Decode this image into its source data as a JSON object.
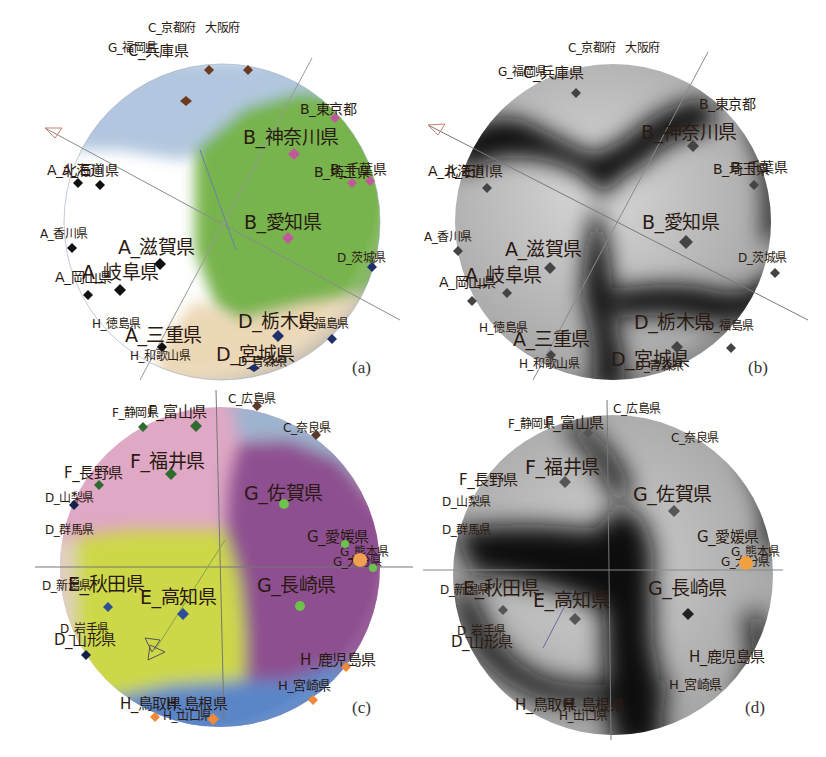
{
  "figure": {
    "panels": [
      {
        "id": "a",
        "tag": "(a)",
        "style": "colored regions",
        "region_colors": {
          "A": "#ffffff",
          "B": "#78b44e",
          "C": "#a9bfd8",
          "D": "#e9d6b4"
        },
        "labels": [
          {
            "text": "C_京都府",
            "size": "s",
            "x": 148,
            "y": 22
          },
          {
            "text": "大阪府",
            "size": "s",
            "x": 205,
            "y": 22
          },
          {
            "text": "G_福岡県",
            "size": "s",
            "x": 108,
            "y": 42
          },
          {
            "text": "C_兵庫県",
            "size": "m",
            "x": 128,
            "y": 44
          },
          {
            "text": "B_東京都",
            "size": "m",
            "x": 300,
            "y": 102
          },
          {
            "text": "B_神奈川県",
            "size": "l",
            "x": 243,
            "y": 128
          },
          {
            "text": "A_北海道",
            "size": "m",
            "x": 47,
            "y": 163
          },
          {
            "text": "A_石川県",
            "size": "m",
            "x": 62,
            "y": 163
          },
          {
            "text": "B_埼玉県",
            "size": "m",
            "x": 314,
            "y": 165
          },
          {
            "text": "B_千葉県",
            "size": "m",
            "x": 330,
            "y": 162
          },
          {
            "text": "B_愛知県",
            "size": "l",
            "x": 244,
            "y": 213
          },
          {
            "text": "A_香川県",
            "size": "s",
            "x": 40,
            "y": 228
          },
          {
            "text": "A_滋賀県",
            "size": "l",
            "x": 118,
            "y": 238
          },
          {
            "text": "D_茨城県",
            "size": "s",
            "x": 337,
            "y": 252
          },
          {
            "text": "A_岡山県",
            "size": "m",
            "x": 55,
            "y": 270
          },
          {
            "text": "A_岐阜県",
            "size": "l",
            "x": 82,
            "y": 263
          },
          {
            "text": "H_徳島県",
            "size": "s",
            "x": 92,
            "y": 318
          },
          {
            "text": "D_栃木県",
            "size": "l",
            "x": 238,
            "y": 312
          },
          {
            "text": "D_福島県",
            "size": "s",
            "x": 300,
            "y": 318
          },
          {
            "text": "A_三重県",
            "size": "l",
            "x": 125,
            "y": 326
          },
          {
            "text": "H_和歌山県",
            "size": "s",
            "x": 130,
            "y": 350
          },
          {
            "text": "D_宮城県",
            "size": "l",
            "x": 216,
            "y": 345
          },
          {
            "text": "D_青森県",
            "size": "s",
            "x": 238,
            "y": 356
          }
        ]
      },
      {
        "id": "b",
        "tag": "(b)",
        "style": "grayscale density",
        "labels": [
          {
            "text": "C_京都府",
            "size": "s",
            "x": 155,
            "y": 42
          },
          {
            "text": "大阪府",
            "size": "s",
            "x": 212,
            "y": 42
          },
          {
            "text": "G_福岡県",
            "size": "s",
            "x": 85,
            "y": 66
          },
          {
            "text": "C_兵庫県",
            "size": "m",
            "x": 110,
            "y": 66
          },
          {
            "text": "B_東京都",
            "size": "m",
            "x": 286,
            "y": 97
          },
          {
            "text": "B_神奈川県",
            "size": "l",
            "x": 228,
            "y": 123
          },
          {
            "text": "A_北海道",
            "size": "m",
            "x": 15,
            "y": 164
          },
          {
            "text": "A_石川県",
            "size": "m",
            "x": 33,
            "y": 164
          },
          {
            "text": "B_埼玉県",
            "size": "m",
            "x": 300,
            "y": 162
          },
          {
            "text": "B_千葉県",
            "size": "m",
            "x": 318,
            "y": 160
          },
          {
            "text": "B_愛知県",
            "size": "l",
            "x": 229,
            "y": 213
          },
          {
            "text": "A_香川県",
            "size": "s",
            "x": 11,
            "y": 231
          },
          {
            "text": "A_滋賀県",
            "size": "l",
            "x": 92,
            "y": 240
          },
          {
            "text": "D_茨城県",
            "size": "s",
            "x": 325,
            "y": 252
          },
          {
            "text": "A_岡山県",
            "size": "m",
            "x": 26,
            "y": 275
          },
          {
            "text": "A_岐阜県",
            "size": "l",
            "x": 52,
            "y": 266
          },
          {
            "text": "H_徳島県",
            "size": "s",
            "x": 66,
            "y": 322
          },
          {
            "text": "D_栃木県",
            "size": "l",
            "x": 221,
            "y": 313
          },
          {
            "text": "D_福島県",
            "size": "s",
            "x": 292,
            "y": 320
          },
          {
            "text": "A_三重県",
            "size": "l",
            "x": 100,
            "y": 330
          },
          {
            "text": "H_和歌山県",
            "size": "s",
            "x": 106,
            "y": 358
          },
          {
            "text": "D_宮城県",
            "size": "l",
            "x": 198,
            "y": 350
          },
          {
            "text": "D_青森県",
            "size": "s",
            "x": 222,
            "y": 360
          }
        ]
      },
      {
        "id": "c",
        "tag": "(c)",
        "style": "colored regions",
        "region_colors": {
          "C": "#9db4cf",
          "D": "#e2d0c2",
          "E": "#cdd84a",
          "F": "#dfa8c4",
          "G": "#8e4f90",
          "H": "#5a86c7"
        },
        "labels": [
          {
            "text": "C_広島県",
            "size": "s",
            "x": 228,
            "y": 13
          },
          {
            "text": "F_静岡県",
            "size": "s",
            "x": 112,
            "y": 27
          },
          {
            "text": "F_富山県",
            "size": "m",
            "x": 148,
            "y": 25
          },
          {
            "text": "C_奈良県",
            "size": "s",
            "x": 283,
            "y": 42
          },
          {
            "text": "F_福井県",
            "size": "l",
            "x": 130,
            "y": 72
          },
          {
            "text": "F_長野県",
            "size": "m",
            "x": 64,
            "y": 86
          },
          {
            "text": "G_佐賀県",
            "size": "l",
            "x": 244,
            "y": 104
          },
          {
            "text": "D_山梨県",
            "size": "s",
            "x": 45,
            "y": 112
          },
          {
            "text": "D_群馬県",
            "size": "s",
            "x": 45,
            "y": 144
          },
          {
            "text": "G_愛媛県",
            "size": "m",
            "x": 307,
            "y": 150
          },
          {
            "text": "G_熊本県",
            "size": "s",
            "x": 340,
            "y": 166
          },
          {
            "text": "G_大分県",
            "size": "s",
            "x": 333,
            "y": 176
          },
          {
            "text": "D_新潟県",
            "size": "s",
            "x": 42,
            "y": 200
          },
          {
            "text": "E_秋田県",
            "size": "l",
            "x": 68,
            "y": 195
          },
          {
            "text": "E_高知県",
            "size": "l",
            "x": 140,
            "y": 208
          },
          {
            "text": "G_長崎県",
            "size": "l",
            "x": 257,
            "y": 196
          },
          {
            "text": "D_岩手県",
            "size": "s",
            "x": 60,
            "y": 243
          },
          {
            "text": "D_山形県",
            "size": "m",
            "x": 54,
            "y": 253
          },
          {
            "text": "H_鹿児島県",
            "size": "m",
            "x": 300,
            "y": 273
          },
          {
            "text": "H_宮崎県",
            "size": "s",
            "x": 278,
            "y": 299
          },
          {
            "text": "H_鳥取県",
            "size": "m",
            "x": 120,
            "y": 317
          },
          {
            "text": "H_島根県",
            "size": "m",
            "x": 166,
            "y": 317
          },
          {
            "text": "H_山口県",
            "size": "s",
            "x": 163,
            "y": 330
          }
        ]
      },
      {
        "id": "d",
        "tag": "(d)",
        "style": "grayscale density",
        "labels": [
          {
            "text": "C_広島県",
            "size": "s",
            "x": 200,
            "y": 23
          },
          {
            "text": "F_静岡県",
            "size": "s",
            "x": 95,
            "y": 38
          },
          {
            "text": "F_富山県",
            "size": "m",
            "x": 132,
            "y": 36
          },
          {
            "text": "C_奈良県",
            "size": "s",
            "x": 258,
            "y": 52
          },
          {
            "text": "F_福井県",
            "size": "l",
            "x": 112,
            "y": 78
          },
          {
            "text": "F_長野県",
            "size": "m",
            "x": 46,
            "y": 93
          },
          {
            "text": "G_佐賀県",
            "size": "l",
            "x": 220,
            "y": 105
          },
          {
            "text": "D_山梨県",
            "size": "s",
            "x": 29,
            "y": 116
          },
          {
            "text": "D_群馬県",
            "size": "s",
            "x": 29,
            "y": 144
          },
          {
            "text": "G_愛媛県",
            "size": "m",
            "x": 284,
            "y": 150
          },
          {
            "text": "G_熊本県",
            "size": "s",
            "x": 318,
            "y": 166
          },
          {
            "text": "G_大分県",
            "size": "s",
            "x": 308,
            "y": 176
          },
          {
            "text": "D_新潟県",
            "size": "s",
            "x": 27,
            "y": 204
          },
          {
            "text": "E_秋田県",
            "size": "l",
            "x": 50,
            "y": 199
          },
          {
            "text": "E_高知県",
            "size": "l",
            "x": 120,
            "y": 211
          },
          {
            "text": "G_長崎県",
            "size": "l",
            "x": 235,
            "y": 199
          },
          {
            "text": "D_岩手県",
            "size": "s",
            "x": 44,
            "y": 245
          },
          {
            "text": "D_山形県",
            "size": "m",
            "x": 38,
            "y": 255
          },
          {
            "text": "H_鹿児島県",
            "size": "m",
            "x": 276,
            "y": 270
          },
          {
            "text": "H_宮崎県",
            "size": "s",
            "x": 256,
            "y": 298
          },
          {
            "text": "H_鳥取県",
            "size": "m",
            "x": 102,
            "y": 318
          },
          {
            "text": "H_島根県",
            "size": "m",
            "x": 150,
            "y": 318
          },
          {
            "text": "H_山口県",
            "size": "s",
            "x": 146,
            "y": 330
          }
        ]
      }
    ]
  }
}
